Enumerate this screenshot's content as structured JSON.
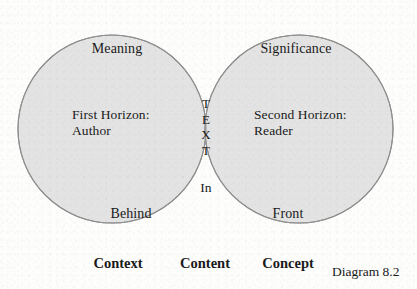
{
  "diagram": {
    "caption": "Diagram 8.2",
    "colors": {
      "background": "#fdfdfc",
      "circle_fill": "#e3e3e3",
      "intersection_fill": "#c8c8c8",
      "outline": "#8f8f8f",
      "text": "#1a1a1a"
    },
    "left_circle": {
      "top_label": "Meaning",
      "middle_label": "First Horizon:\nAuthor",
      "bottom_label": "Behind"
    },
    "right_circle": {
      "top_label": "Significance",
      "middle_label": "Second Horizon:\nReader",
      "bottom_label": "Front"
    },
    "intersection": {
      "stacked_label": [
        "T",
        "E",
        "X",
        "T"
      ],
      "bottom_label": "In"
    },
    "bottom_captions": [
      {
        "label": "Context"
      },
      {
        "label": "Content"
      },
      {
        "label": "Concept"
      }
    ]
  }
}
